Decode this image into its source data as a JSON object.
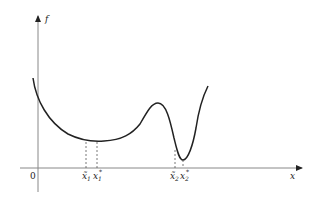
{
  "diagram": {
    "y_axis_label": "f",
    "x_axis_label": "x",
    "origin_label": "0",
    "marks": [
      {
        "base": "x̃",
        "sub": "1",
        "x": 86
      },
      {
        "base": "x",
        "sub": "1",
        "sup": "*",
        "x": 97
      },
      {
        "base": "x̃",
        "sub": "2",
        "x": 175
      },
      {
        "base": "x",
        "sub": "2",
        "sup": "*",
        "x": 183
      }
    ],
    "colors": {
      "axis": "#888888",
      "curve": "#222222",
      "dash": "#555555"
    }
  }
}
